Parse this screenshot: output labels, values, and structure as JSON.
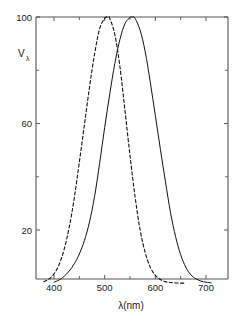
{
  "chart_data": {
    "type": "line",
    "title": "",
    "xlabel": "λ(nm)",
    "ylabel": "Vλ",
    "ylabel_base": "V",
    "ylabel_sub": "λ",
    "xlim": [
      360,
      740
    ],
    "ylim": [
      0,
      100
    ],
    "grid": false,
    "legend": "none",
    "xticks": [
      400,
      500,
      600,
      700
    ],
    "xtick_labels": [
      "400",
      "500",
      "600",
      "700"
    ],
    "xminor_ticks": [
      450,
      550,
      650
    ],
    "yticks": [
      20,
      60,
      100
    ],
    "ytick_labels": [
      "20",
      "60",
      "100"
    ],
    "yminor_ticks": [
      40,
      80
    ],
    "series": [
      {
        "name": "scotopic",
        "style": "dashed",
        "color": "#111111",
        "peak_x": 507,
        "peak_y": 100,
        "x": [
          380,
          390,
          400,
          410,
          420,
          430,
          440,
          450,
          460,
          470,
          480,
          490,
          500,
          507,
          510,
          520,
          530,
          540,
          550,
          560,
          570,
          580,
          590,
          600,
          610,
          620,
          630,
          640,
          650,
          660
        ],
        "values": [
          0.6,
          1.6,
          3.5,
          7.0,
          12.7,
          21.0,
          32.0,
          45.5,
          59.5,
          73.5,
          86.0,
          95.5,
          99.5,
          100.0,
          99.5,
          93.5,
          81.5,
          65.0,
          48.0,
          32.5,
          20.0,
          11.5,
          6.0,
          3.0,
          1.4,
          0.6,
          0.3,
          0.12,
          0.05,
          0.02
        ]
      },
      {
        "name": "photopic",
        "style": "solid",
        "color": "#111111",
        "peak_x": 555,
        "peak_y": 100,
        "x": [
          400,
          410,
          420,
          430,
          440,
          450,
          460,
          470,
          480,
          490,
          500,
          510,
          520,
          530,
          540,
          550,
          555,
          560,
          570,
          580,
          590,
          600,
          610,
          620,
          630,
          640,
          650,
          660,
          670,
          680,
          690,
          700,
          710
        ],
        "values": [
          0.4,
          1.2,
          2.6,
          4.6,
          7.3,
          11.0,
          16.0,
          23.0,
          32.5,
          45.0,
          58.5,
          71.0,
          82.5,
          91.5,
          97.5,
          99.8,
          100.0,
          99.5,
          95.0,
          87.0,
          75.5,
          63.0,
          50.3,
          38.1,
          26.5,
          17.5,
          10.7,
          6.1,
          3.2,
          1.7,
          0.8,
          0.4,
          0.15
        ]
      }
    ]
  },
  "axes": {
    "y_label_base": "V",
    "y_label_sub": "λ",
    "x_title": "λ(nm)"
  }
}
